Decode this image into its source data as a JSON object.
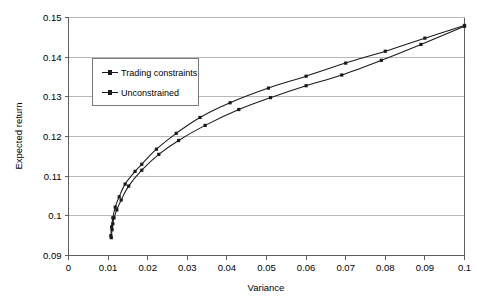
{
  "chart_data": {
    "type": "line",
    "title": "",
    "xlabel": "Variance",
    "ylabel": "Expected return",
    "xlim": [
      0,
      0.1
    ],
    "ylim": [
      0.09,
      0.15
    ],
    "grid": true,
    "legend_position": "upper-left-inside",
    "x_ticks": [
      "0",
      "0.01",
      "0.02",
      "0.03",
      "0.04",
      "0.05",
      "0.06",
      "0.07",
      "0.08",
      "0.09",
      "0.1"
    ],
    "x_tick_values": [
      0,
      0.01,
      0.02,
      0.03,
      0.04,
      0.05,
      0.06,
      0.07,
      0.08,
      0.09,
      0.1
    ],
    "y_ticks": [
      "0.09",
      "0.1",
      "0.11",
      "0.12",
      "0.13",
      "0.14",
      "0.15"
    ],
    "y_tick_values": [
      0.09,
      0.1,
      0.11,
      0.12,
      0.13,
      0.14,
      0.15
    ],
    "series": [
      {
        "name": "Trading constraints",
        "marker": "square",
        "color": "#1a1a1a",
        "points": [
          {
            "x": 0.0108,
            "y": 0.0945
          },
          {
            "x": 0.011,
            "y": 0.0965
          },
          {
            "x": 0.0112,
            "y": 0.098
          },
          {
            "x": 0.0115,
            "y": 0.0995
          },
          {
            "x": 0.0122,
            "y": 0.1015
          },
          {
            "x": 0.0133,
            "y": 0.104
          },
          {
            "x": 0.0152,
            "y": 0.1075
          },
          {
            "x": 0.0185,
            "y": 0.1115
          },
          {
            "x": 0.0228,
            "y": 0.1155
          },
          {
            "x": 0.0278,
            "y": 0.119
          },
          {
            "x": 0.0345,
            "y": 0.1228
          },
          {
            "x": 0.043,
            "y": 0.1268
          },
          {
            "x": 0.051,
            "y": 0.1298
          },
          {
            "x": 0.06,
            "y": 0.1328
          },
          {
            "x": 0.069,
            "y": 0.1355
          },
          {
            "x": 0.079,
            "y": 0.1392
          },
          {
            "x": 0.089,
            "y": 0.1432
          },
          {
            "x": 0.1,
            "y": 0.1478
          }
        ]
      },
      {
        "name": "Unconstrained",
        "marker": "square",
        "color": "#1a1a1a",
        "points": [
          {
            "x": 0.0107,
            "y": 0.095
          },
          {
            "x": 0.0109,
            "y": 0.0972
          },
          {
            "x": 0.0112,
            "y": 0.0995
          },
          {
            "x": 0.0118,
            "y": 0.1022
          },
          {
            "x": 0.0128,
            "y": 0.1048
          },
          {
            "x": 0.0143,
            "y": 0.108
          },
          {
            "x": 0.0168,
            "y": 0.1112
          },
          {
            "x": 0.0185,
            "y": 0.113
          },
          {
            "x": 0.0222,
            "y": 0.1168
          },
          {
            "x": 0.0272,
            "y": 0.1208
          },
          {
            "x": 0.0332,
            "y": 0.1248
          },
          {
            "x": 0.0408,
            "y": 0.1285
          },
          {
            "x": 0.0505,
            "y": 0.1322
          },
          {
            "x": 0.06,
            "y": 0.1352
          },
          {
            "x": 0.07,
            "y": 0.1385
          },
          {
            "x": 0.08,
            "y": 0.1415
          },
          {
            "x": 0.09,
            "y": 0.1448
          },
          {
            "x": 0.1,
            "y": 0.148
          }
        ]
      }
    ]
  },
  "legend": {
    "entries": [
      {
        "label": "Trading constraints"
      },
      {
        "label": "Unconstrained"
      }
    ]
  }
}
